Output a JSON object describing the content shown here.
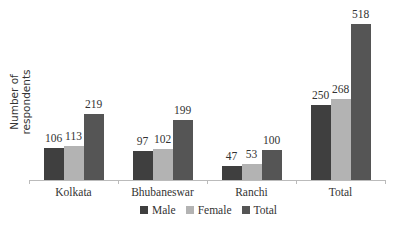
{
  "chart_data": {
    "type": "bar",
    "title": "",
    "xlabel": "",
    "ylabel": "Number of respondents",
    "categories": [
      "Kolkata",
      "Bhubaneswar",
      "Ranchi",
      "Total"
    ],
    "series": [
      {
        "name": "Male",
        "values": [
          106,
          97,
          47,
          250
        ],
        "color": "#3f3f3f"
      },
      {
        "name": "Female",
        "values": [
          113,
          102,
          53,
          268
        ],
        "color": "#b3b3b3"
      },
      {
        "name": "Total",
        "values": [
          219,
          199,
          100,
          518
        ],
        "color": "#555555"
      }
    ],
    "ylim": [
      0,
      518
    ],
    "grid": false,
    "legend_position": "bottom",
    "data_labels": true
  }
}
